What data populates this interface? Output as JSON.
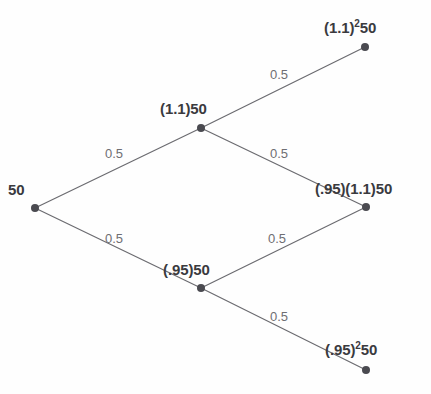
{
  "diagram": {
    "type": "binomial-tree",
    "width": 431,
    "height": 394,
    "background_color": "#fefefe",
    "edge_color": "#6b6b70",
    "node_color": "#4a4a50",
    "node_label_color": "#3a3a3e",
    "edge_label_color": "#6e6e73"
  },
  "nodes": [
    {
      "id": "root",
      "label_main": "50",
      "label_sup": "",
      "label_tail": "",
      "x": 35,
      "y": 208,
      "label_x": 8,
      "label_y": 182
    },
    {
      "id": "up",
      "label_main": "(1.1)50",
      "label_sup": "",
      "label_tail": "",
      "x": 201,
      "y": 128,
      "label_x": 160,
      "label_y": 101
    },
    {
      "id": "down",
      "label_main": "(.95)50",
      "label_sup": "",
      "label_tail": "",
      "x": 201,
      "y": 288,
      "label_x": 163,
      "label_y": 262
    },
    {
      "id": "up-up",
      "label_main": "(1.1)",
      "label_sup": "2",
      "label_tail": "50",
      "x": 365,
      "y": 47,
      "label_x": 324,
      "label_y": 20
    },
    {
      "id": "up-down",
      "label_main": "(.95)(1.1)50",
      "label_sup": "",
      "label_tail": "",
      "x": 366,
      "y": 207,
      "label_x": 315,
      "label_y": 181
    },
    {
      "id": "down-down",
      "label_main": "(.95)",
      "label_sup": "2",
      "label_tail": "50",
      "x": 366,
      "y": 370,
      "label_x": 325,
      "label_y": 342
    }
  ],
  "edges": [
    {
      "id": "root-up",
      "from": "root",
      "to": "up",
      "x1": 35,
      "y1": 208,
      "x2": 201,
      "y2": 128,
      "probability": "0.5",
      "label_x": 105,
      "label_y": 147
    },
    {
      "id": "root-down",
      "from": "root",
      "to": "down",
      "x1": 35,
      "y1": 208,
      "x2": 201,
      "y2": 288,
      "probability": "0.5",
      "label_x": 105,
      "label_y": 232
    },
    {
      "id": "up-upup",
      "from": "up",
      "to": "up-up",
      "x1": 201,
      "y1": 128,
      "x2": 365,
      "y2": 47,
      "probability": "0.5",
      "label_x": 270,
      "label_y": 68
    },
    {
      "id": "up-updown",
      "from": "up",
      "to": "up-down",
      "x1": 201,
      "y1": 128,
      "x2": 366,
      "y2": 207,
      "probability": "0.5",
      "label_x": 270,
      "label_y": 147
    },
    {
      "id": "down-updown",
      "from": "down",
      "to": "up-down",
      "x1": 201,
      "y1": 288,
      "x2": 366,
      "y2": 207,
      "probability": "0.5",
      "label_x": 268,
      "label_y": 232
    },
    {
      "id": "down-downdown",
      "from": "down",
      "to": "down-down",
      "x1": 201,
      "y1": 288,
      "x2": 366,
      "y2": 370,
      "probability": "0.5",
      "label_x": 270,
      "label_y": 310
    }
  ]
}
